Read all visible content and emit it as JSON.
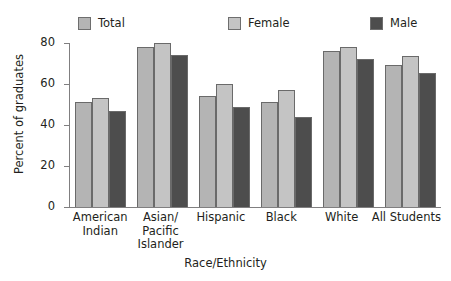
{
  "chart_data": {
    "type": "bar",
    "title": "",
    "xlabel": "Race/Ethnicity",
    "ylabel": "Percent of graduates",
    "categories": [
      "American Indian",
      "Asian/ Pacific Islander",
      "Hispanic",
      "Black",
      "White",
      "All Students"
    ],
    "category_lines": [
      [
        "American",
        "Indian"
      ],
      [
        "Asian/",
        "Pacific",
        "Islander"
      ],
      [
        "Hispanic"
      ],
      [
        "Black"
      ],
      [
        "White"
      ],
      [
        "All Students"
      ]
    ],
    "series": [
      {
        "name": "Total",
        "color": "#b4b4b4",
        "values": [
          51,
          78,
          54,
          51,
          76,
          69.5
        ]
      },
      {
        "name": "Female",
        "color": "#c4c4c4",
        "values": [
          53,
          80,
          60,
          57,
          78,
          73.5
        ]
      },
      {
        "name": "Male",
        "color": "#4d4d4d",
        "values": [
          47,
          74,
          49,
          44,
          72,
          65.5
        ]
      }
    ],
    "ylim": [
      0,
      80
    ],
    "yticks": [
      0,
      20,
      40,
      60,
      80
    ],
    "ytick_labels": [
      "0",
      "20",
      "40",
      "60",
      "80"
    ],
    "grid": false,
    "legend_position": "top"
  },
  "legend": {
    "items": [
      {
        "label": "Total",
        "color": "#b4b4b4"
      },
      {
        "label": "Female",
        "color": "#c4c4c4"
      },
      {
        "label": "Male",
        "color": "#4d4d4d"
      }
    ]
  },
  "axes": {
    "y_title": "Percent of graduates",
    "x_title": "Race/Ethnicity",
    "y_tick_labels": [
      "80",
      "60",
      "40",
      "20",
      "0"
    ]
  }
}
